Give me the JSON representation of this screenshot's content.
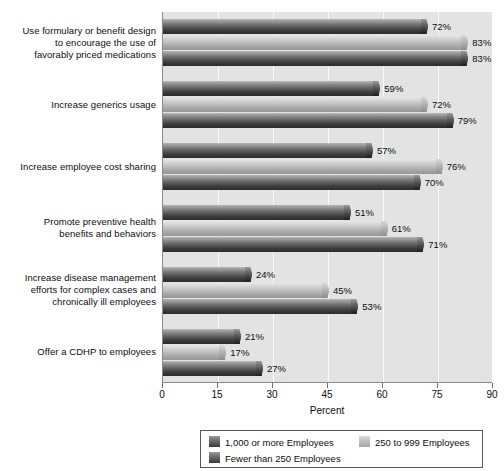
{
  "chart_data": {
    "type": "bar",
    "orientation": "horizontal",
    "title": "",
    "xlabel": "Percent",
    "ylabel": "",
    "xlim": [
      0,
      90
    ],
    "xticks": [
      "0",
      "15",
      "30",
      "45",
      "60",
      "75",
      "90"
    ],
    "grid": true,
    "legend_position": "bottom",
    "categories": [
      "Use formulary or benefit design to encourage the use of favorably priced medications",
      "Increase generics usage",
      "Increase employee cost sharing",
      "Promote preventive health benefits and behaviors",
      "Increase disease management efforts for complex cases and chronically ill employees",
      "Offer a CDHP to employees"
    ],
    "category_lines": [
      [
        "Use formulary or benefit design",
        "to encourage the use of",
        "favorably priced medications"
      ],
      [
        "Increase generics usage"
      ],
      [
        "Increase employee cost sharing"
      ],
      [
        "Promote preventive health",
        "benefits and behaviors"
      ],
      [
        "Increase disease management",
        "efforts for complex cases and",
        "chronically ill employees"
      ],
      [
        "Offer a CDHP to employees"
      ]
    ],
    "series": [
      {
        "name": "1,000 or more Employees",
        "color": "#4a4a4a",
        "values": [
          72,
          59,
          57,
          51,
          24,
          21
        ],
        "labels": [
          "72%",
          "59%",
          "57%",
          "51%",
          "24%",
          "21%"
        ]
      },
      {
        "name": "250 to 999 Employees",
        "color": "#c0c0c0",
        "values": [
          83,
          72,
          76,
          61,
          45,
          17
        ],
        "labels": [
          "83%",
          "72%",
          "76%",
          "61%",
          "45%",
          "17%"
        ]
      },
      {
        "name": "Fewer than 250 Employees",
        "color": "#4a4a4a",
        "values": [
          83,
          79,
          70,
          71,
          53,
          27
        ],
        "labels": [
          "83%",
          "79%",
          "70%",
          "71%",
          "53%",
          "27%"
        ]
      }
    ]
  },
  "legend": {
    "items": [
      {
        "label": "1,000 or more Employees",
        "swatch": "dark"
      },
      {
        "label": "250 to 999 Employees",
        "swatch": "light"
      },
      {
        "label": "Fewer than 250 Employees",
        "swatch": "dark"
      }
    ]
  },
  "axis": {
    "x_title": "Percent"
  }
}
